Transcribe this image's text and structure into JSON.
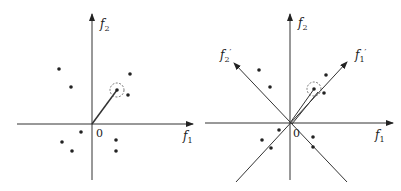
{
  "left_panel": {
    "axis_x_label": "f",
    "axis_x_sub": "1",
    "axis_y_label": "f",
    "axis_y_sub": "2",
    "origin_label": "0",
    "points": [
      [
        59,
        69
      ],
      [
        71,
        87
      ],
      [
        130,
        74
      ],
      [
        128,
        95
      ],
      [
        81,
        132
      ],
      [
        62,
        142
      ],
      [
        72,
        151
      ],
      [
        116,
        140
      ],
      [
        116,
        151
      ]
    ],
    "highlighted_point": [
      117,
      90
    ],
    "vector_from_origin": true
  },
  "right_panel": {
    "axis_x_label": "f",
    "axis_x_sub": "1",
    "axis_y_label": "f",
    "axis_y_sub": "2",
    "rotated_axis_1_label": "f",
    "rotated_axis_1_sub": "1",
    "rotated_axis_1_prime": "′",
    "rotated_axis_2_label": "f",
    "rotated_axis_2_sub": "2",
    "rotated_axis_2_prime": "′",
    "origin_label": "0",
    "points": [
      [
        259,
        70
      ],
      [
        270,
        87
      ],
      [
        326,
        75
      ],
      [
        324,
        93
      ],
      [
        279,
        130
      ],
      [
        262,
        140
      ],
      [
        271,
        148
      ],
      [
        313,
        137
      ],
      [
        313,
        147
      ]
    ],
    "highlighted_point": [
      314,
      89
    ]
  },
  "colors": {
    "ink": "#222222",
    "background": "#ffffff"
  }
}
